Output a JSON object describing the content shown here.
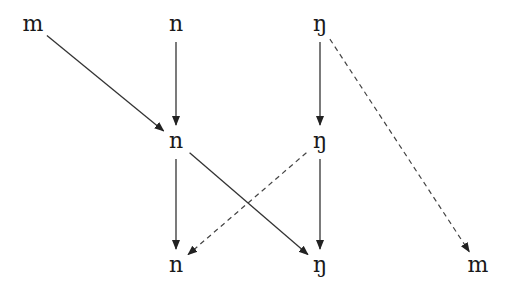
{
  "diagram": {
    "type": "directed-graph",
    "nodes": [
      {
        "id": "top-m",
        "label": "m",
        "row": 0,
        "col": 0
      },
      {
        "id": "top-n",
        "label": "n",
        "row": 0,
        "col": 1
      },
      {
        "id": "top-ng",
        "label": "ŋ",
        "row": 0,
        "col": 2
      },
      {
        "id": "mid-n",
        "label": "n",
        "row": 1,
        "col": 1
      },
      {
        "id": "mid-ng",
        "label": "ŋ",
        "row": 1,
        "col": 2
      },
      {
        "id": "bot-n",
        "label": "n",
        "row": 2,
        "col": 1
      },
      {
        "id": "bot-ng",
        "label": "ŋ",
        "row": 2,
        "col": 2
      },
      {
        "id": "bot-m",
        "label": "m",
        "row": 2,
        "col": 3
      }
    ],
    "edges": [
      {
        "from": "top-m",
        "to": "mid-n",
        "style": "solid"
      },
      {
        "from": "top-n",
        "to": "mid-n",
        "style": "solid"
      },
      {
        "from": "top-ng",
        "to": "mid-ng",
        "style": "solid"
      },
      {
        "from": "top-ng",
        "to": "bot-m",
        "style": "dashed"
      },
      {
        "from": "mid-n",
        "to": "bot-n",
        "style": "solid"
      },
      {
        "from": "mid-n",
        "to": "bot-ng",
        "style": "solid"
      },
      {
        "from": "mid-ng",
        "to": "bot-n",
        "style": "dashed"
      },
      {
        "from": "mid-ng",
        "to": "bot-ng",
        "style": "solid"
      }
    ]
  }
}
